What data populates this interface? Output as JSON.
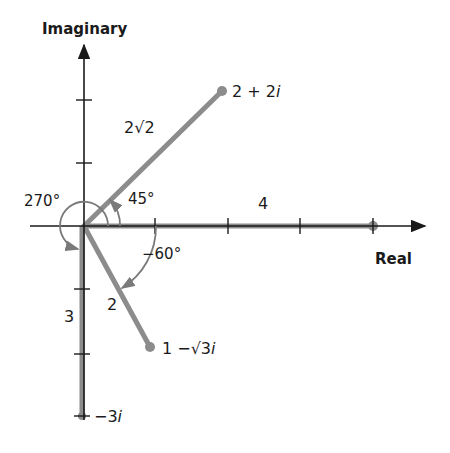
{
  "axes": {
    "x_label": "Real",
    "y_label": "Imaginary"
  },
  "points": [
    {
      "name": "2 + 2i",
      "label": "2 + 2",
      "suffix": "i",
      "modulus_label": "2√2",
      "angle_label": "45°",
      "re": 2,
      "im": 2
    },
    {
      "name": "4",
      "modulus_label": "4",
      "re": 4,
      "im": 0
    },
    {
      "name": "1 − √3i",
      "label_prefix": "1 −√3",
      "suffix": "i",
      "modulus_label": "2",
      "angle_label": "−60°",
      "re": 1,
      "im": -1.732
    },
    {
      "name": "−3i",
      "label": "−3",
      "suffix": "i",
      "modulus_label": "3",
      "angle_label": "270°",
      "re": 0,
      "im": -3
    }
  ],
  "colors": {
    "axis": "#1a1a1a",
    "vector": "#8c8c8c",
    "arc": "#7a7a7a"
  }
}
